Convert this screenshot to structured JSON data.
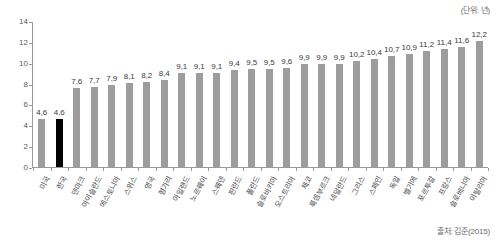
{
  "unit_note": "(단위: 년)",
  "source_note": "출처: 김준(2015)",
  "colors": {
    "bar": "#9d9d9d",
    "highlight_bar": "#000000",
    "axis": "#9a9a9a",
    "text": "#4a4a4a",
    "background": "#ffffff"
  },
  "chart_data": {
    "type": "bar",
    "title": "",
    "subtitle": "",
    "xlabel": "",
    "ylabel": "",
    "unit": "(단위: 년)",
    "source": "출처: 김준(2015)",
    "ylim": [
      0,
      14
    ],
    "yticks": [
      0,
      2,
      4,
      6,
      8,
      10,
      12,
      14
    ],
    "ytick_labels": [
      "0",
      "2",
      "4",
      "6",
      "8",
      "10",
      "12",
      "14"
    ],
    "grid": false,
    "legend": null,
    "highlight_category": "한국",
    "decimal_separator": ",",
    "categories": [
      "미국",
      "한국",
      "덴마크",
      "아이슬란드",
      "에스토니아",
      "스위스",
      "영국",
      "헝가리",
      "아일랜드",
      "노르웨이",
      "스웨덴",
      "핀란드",
      "폴란드",
      "슬로바키아",
      "오스트리아",
      "체코",
      "룩셈부르크",
      "네덜란드",
      "그리스",
      "스페인",
      "독일",
      "벨기에",
      "포르투갈",
      "프랑스",
      "슬로베니아",
      "이탈리아"
    ],
    "values": [
      4.6,
      4.6,
      7.6,
      7.7,
      7.9,
      8.1,
      8.2,
      8.4,
      9.1,
      9.1,
      9.1,
      9.4,
      9.5,
      9.5,
      9.6,
      9.9,
      9.9,
      9.9,
      10.2,
      10.4,
      10.7,
      10.9,
      11.2,
      11.4,
      11.6,
      12.2
    ],
    "value_labels": [
      "4,6",
      "4,6",
      "7,6",
      "7,7",
      "7,9",
      "8,1",
      "8,2",
      "8,4",
      "9,1",
      "9,1",
      "9,1",
      "9,4",
      "9,5",
      "9,5",
      "9,6",
      "9,9",
      "9,9",
      "9,9",
      "10,2",
      "10,4",
      "10,7",
      "10,9",
      "11,2",
      "11,4",
      "11,6",
      "12,2"
    ]
  }
}
